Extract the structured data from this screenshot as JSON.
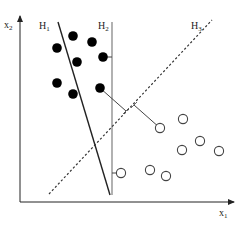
{
  "diagram": {
    "title": "",
    "axes": {
      "x_label": "x",
      "x_sub": "1",
      "y_label": "x",
      "y_sub": "2"
    },
    "hyperplanes": [
      {
        "label": "H",
        "sub": "1",
        "style": "solid",
        "color": "#222222"
      },
      {
        "label": "H",
        "sub": "2",
        "style": "solid",
        "color": "#888888"
      },
      {
        "label": "H",
        "sub": "3",
        "style": "dashed",
        "color": "#333333"
      }
    ],
    "class_filled": {
      "name": "filled-class",
      "color": "#000000",
      "points": [
        [
          73,
          36
        ],
        [
          57,
          48
        ],
        [
          92,
          42
        ],
        [
          77,
          62
        ],
        [
          103,
          57
        ],
        [
          57,
          83
        ],
        [
          73,
          94
        ],
        [
          100,
          88
        ]
      ]
    },
    "class_open": {
      "name": "open-class",
      "color": "#444444",
      "points": [
        [
          160,
          128
        ],
        [
          183,
          119
        ],
        [
          200,
          141
        ],
        [
          182,
          150
        ],
        [
          219,
          151
        ],
        [
          121,
          173
        ],
        [
          150,
          170
        ],
        [
          166,
          176
        ]
      ]
    }
  }
}
